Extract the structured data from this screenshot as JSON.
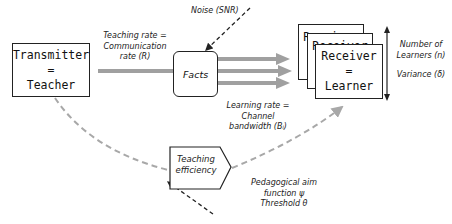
{
  "nodes": {
    "transmitter": {
      "line1": "Transmitter",
      "line2": "=",
      "line3": "Teacher"
    },
    "facts": {
      "label": "Facts"
    },
    "receiver": {
      "line1": "Receiver",
      "line2": "=",
      "line3": "Learner",
      "back_label": "Receiver"
    },
    "efficiency": {
      "line1": "Teaching",
      "line2": "efficiency"
    }
  },
  "labels": {
    "noise": "Noise (SNR)",
    "teaching_rate": [
      "Teaching rate =",
      "Communication",
      "rate  (R)"
    ],
    "learning_rate": [
      "Learning rate =",
      "Channel",
      "bandwidth  (Bᵢ)"
    ],
    "number_learners": [
      "Number of",
      "Learners (n)"
    ],
    "variance": "Variance (δ)",
    "pedagogical": [
      "Pedagogical aim",
      "function ψ",
      "Threshold θ"
    ]
  },
  "colors": {
    "thick_arrow": "#a0a0a0",
    "dashed_grey": "#a8a8a8",
    "dashed_dark": "#333333",
    "border": "#222222"
  }
}
